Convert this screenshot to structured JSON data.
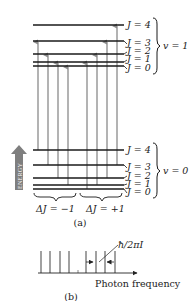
{
  "panel_a": {
    "caption": "(a)",
    "energy_label": "ENERGY",
    "upper_band": {
      "label": "v = 1",
      "levels": [
        {
          "j_label": "J = 4",
          "y": 25
        },
        {
          "j_label": "J = 3",
          "y": 41
        },
        {
          "j_label": "J = 2",
          "y": 54
        },
        {
          "j_label": "J = 1",
          "y": 62
        },
        {
          "j_label": "J = 0",
          "y": 66
        }
      ]
    },
    "lower_band": {
      "label": "v = 0",
      "levels": [
        {
          "j_label": "J = 4",
          "y": 150
        },
        {
          "j_label": "J = 3",
          "y": 165
        },
        {
          "j_label": "J = 2",
          "y": 178
        },
        {
          "j_label": "J = 1",
          "y": 185
        },
        {
          "j_label": "J = 0",
          "y": 189
        }
      ]
    },
    "branches": [
      {
        "label": "ΔJ = −1",
        "transitions": [
          {
            "from": "J=4",
            "to": "J=3"
          },
          {
            "from": "J=3",
            "to": "J=2"
          },
          {
            "from": "J=2",
            "to": "J=1"
          },
          {
            "from": "J=1",
            "to": "J=0"
          }
        ]
      },
      {
        "label": "ΔJ = +1",
        "transitions": [
          {
            "from": "J=0",
            "to": "J=1"
          },
          {
            "from": "J=1",
            "to": "J=2"
          },
          {
            "from": "J=2",
            "to": "J=3"
          },
          {
            "from": "J=3",
            "to": "J=4"
          }
        ]
      }
    ]
  },
  "panel_b": {
    "caption": "(b)",
    "axis_label": "Photon frequency",
    "spacing_label": "ħ/2πI",
    "line_count": 8
  },
  "colors": {
    "level_line": "#1a1a1a",
    "arrow": "#8a8a8a",
    "energy_arrow": "#7f7f7f",
    "text": "#222222"
  }
}
